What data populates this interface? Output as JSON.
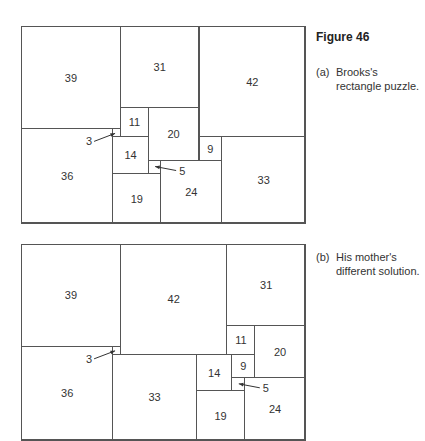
{
  "figure": {
    "title": "Figure 46",
    "captions": [
      {
        "tag": "(a)",
        "text": "Brooks's rectangle puzzle."
      },
      {
        "tag": "(b)",
        "text": "His mother's different solution."
      }
    ]
  },
  "puzzles": [
    {
      "name": "brooks",
      "width_units": 112,
      "height_units": 75,
      "squares": [
        {
          "size": 39,
          "x": 0,
          "y": 0
        },
        {
          "size": 31,
          "x": 39,
          "y": 0
        },
        {
          "size": 42,
          "x": 70,
          "y": 0
        },
        {
          "size": 36,
          "x": 0,
          "y": 39
        },
        {
          "size": 3,
          "x": 36,
          "y": 39
        },
        {
          "size": 11,
          "x": 39,
          "y": 31
        },
        {
          "size": 20,
          "x": 50,
          "y": 31
        },
        {
          "size": 14,
          "x": 36,
          "y": 42
        },
        {
          "size": 5,
          "x": 50,
          "y": 51
        },
        {
          "size": 19,
          "x": 36,
          "y": 56
        },
        {
          "size": 24,
          "x": 55,
          "y": 51
        },
        {
          "size": 9,
          "x": 70,
          "y": 42
        },
        {
          "size": 33,
          "x": 79,
          "y": 42
        }
      ]
    },
    {
      "name": "mother",
      "width_units": 112,
      "height_units": 75,
      "squares": [
        {
          "size": 39,
          "x": 0,
          "y": 0
        },
        {
          "size": 42,
          "x": 39,
          "y": 0
        },
        {
          "size": 31,
          "x": 81,
          "y": 0
        },
        {
          "size": 36,
          "x": 0,
          "y": 39
        },
        {
          "size": 3,
          "x": 36,
          "y": 39
        },
        {
          "size": 33,
          "x": 36,
          "y": 42
        },
        {
          "size": 11,
          "x": 81,
          "y": 31
        },
        {
          "size": 20,
          "x": 92,
          "y": 31
        },
        {
          "size": 14,
          "x": 69,
          "y": 42
        },
        {
          "size": 9,
          "x": 83,
          "y": 42
        },
        {
          "size": 5,
          "x": 83,
          "y": 51
        },
        {
          "size": 19,
          "x": 69,
          "y": 56
        },
        {
          "size": 24,
          "x": 88,
          "y": 51
        }
      ]
    }
  ],
  "labels": {
    "three": "3",
    "five": "5"
  }
}
